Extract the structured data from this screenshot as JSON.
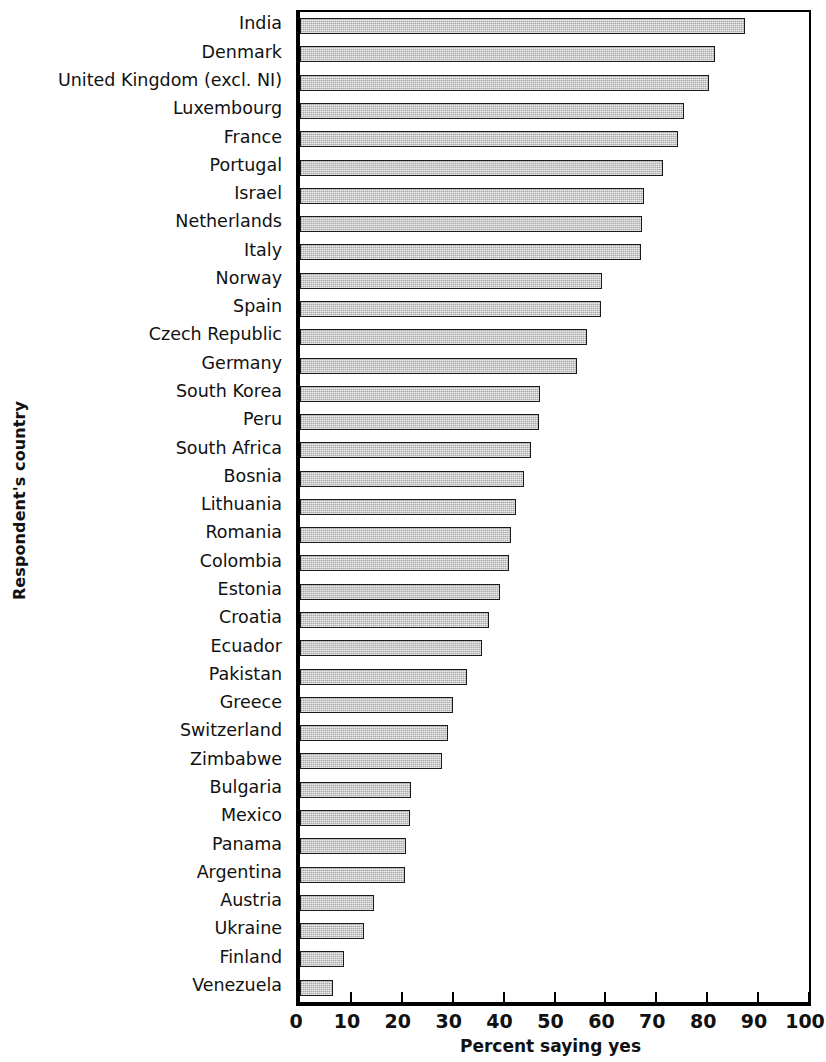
{
  "chart_data": {
    "type": "bar",
    "orientation": "horizontal",
    "title": "",
    "xlabel": "Percent saying yes",
    "ylabel": "Respondent's country",
    "xlim": [
      0,
      100
    ],
    "xticks": [
      0,
      10,
      20,
      30,
      40,
      50,
      60,
      70,
      80,
      90,
      100
    ],
    "xtick_labels": [
      "0",
      "10",
      "20",
      "30",
      "40",
      "50",
      "60",
      "70",
      "80",
      "90",
      "100"
    ],
    "grid": false,
    "legend": null,
    "bar_style": {
      "fill": "#c9c9c9",
      "pattern": "dithered-gray",
      "edge": "#1a1a1a"
    },
    "categories": [
      "India",
      "Denmark",
      "United Kingdom (excl. NI)",
      "Luxembourg",
      "France",
      "Portugal",
      "Israel",
      "Netherlands",
      "Italy",
      "Norway",
      "Spain",
      "Czech Republic",
      "Germany",
      "South Korea",
      "Peru",
      "South Africa",
      "Bosnia",
      "Lithuania",
      "Romania",
      "Colombia",
      "Estonia",
      "Croatia",
      "Ecuador",
      "Pakistan",
      "Greece",
      "Switzerland",
      "Zimbabwe",
      "Bulgaria",
      "Mexico",
      "Panama",
      "Argentina",
      "Austria",
      "Ukraine",
      "Finland",
      "Venezuela"
    ],
    "values": [
      87.5,
      81.6,
      80.4,
      75.4,
      74.2,
      71.4,
      67.6,
      67.2,
      67.0,
      59.4,
      59.2,
      56.4,
      54.4,
      47.2,
      47.0,
      45.4,
      44.0,
      42.4,
      41.4,
      41.0,
      39.2,
      37.2,
      35.8,
      32.8,
      30.0,
      29.0,
      27.8,
      21.8,
      21.6,
      20.8,
      20.6,
      14.6,
      12.6,
      8.6,
      6.4
    ]
  }
}
